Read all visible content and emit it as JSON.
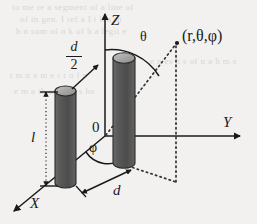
{
  "figure": {
    "background_color": "#f2f1ef",
    "ink_color": "#1a1a1a",
    "cylinder_body_color": "#565656",
    "cylinder_cap_color": "#a8a8a8",
    "axes": [
      {
        "name": "z-axis",
        "label": "Z"
      },
      {
        "name": "y-axis",
        "label": "Y"
      },
      {
        "name": "x-axis",
        "label": "X"
      }
    ],
    "origin_label": "0",
    "angles": [
      {
        "name": "theta-angle",
        "label": "θ"
      },
      {
        "name": "phi-angle",
        "label": "φ"
      }
    ],
    "point_label": "(r,θ,φ)",
    "dimensions": [
      {
        "name": "length-dimension",
        "label": "l"
      },
      {
        "name": "half-diameter-dimension",
        "numerator": "d",
        "denominator": "2"
      },
      {
        "name": "separation-dimension",
        "label": "d"
      }
    ],
    "objects": [
      {
        "name": "left-cylinder"
      },
      {
        "name": "right-cylinder"
      }
    ],
    "ghost_text": [
      "to me re a segment of a line of",
      "of in gen. I ref a I t h a in",
      "h n sum of n k of h a legit e",
      "e n es h s of n a h m e",
      "t m  n  a  m e r t  o f  n",
      "e m a th on of a s he"
    ]
  }
}
